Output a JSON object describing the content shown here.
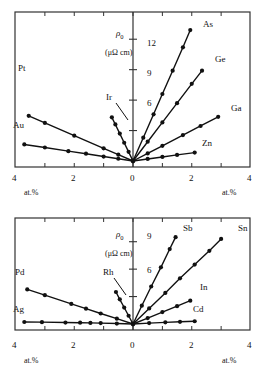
{
  "figure": {
    "title": "",
    "panels": [
      {
        "id": "top",
        "y_axis_label": "ρ",
        "y_axis_label_sub": "0",
        "y_axis_units": "(μΩ cm)",
        "y_ticks": [
          3,
          6,
          9,
          12
        ],
        "y_tick_labels": [
          "",
          "6",
          "9",
          "12"
        ],
        "x_ticks": [
          -4,
          -3,
          -2,
          -1,
          0,
          1,
          2,
          3,
          4
        ],
        "x_tick_labels": [
          "4",
          "",
          "2",
          "",
          "0",
          "",
          "2",
          "",
          "4"
        ],
        "x_axis_label_left": "at.%",
        "x_axis_label_right": "at.%",
        "ylim": [
          0,
          13.5
        ],
        "xlim": [
          -4,
          4
        ]
      },
      {
        "id": "bottom",
        "y_axis_label": "ρ",
        "y_axis_label_sub": "0",
        "y_axis_units": "(μΩ cm)",
        "y_ticks": [
          3,
          6,
          9
        ],
        "y_tick_labels": [
          "",
          "6",
          "9"
        ],
        "x_ticks": [
          -4,
          -3,
          -2,
          -1,
          0,
          1,
          2,
          3,
          4
        ],
        "x_tick_labels": [
          "4",
          "",
          "2",
          "",
          "0",
          "",
          "2",
          "",
          "4"
        ],
        "x_axis_label_left": "at.%",
        "x_axis_label_right": "at.%",
        "ylim": [
          0,
          10.5
        ],
        "xlim": [
          -4,
          4
        ]
      }
    ]
  },
  "chart_data": [
    {
      "type": "line",
      "panel": "top",
      "title": "",
      "xlabel": "at.%",
      "ylabel": "ρ₀ (μΩ cm)",
      "xlim": [
        -4,
        4
      ],
      "ylim": [
        0,
        13.5
      ],
      "xticks": [
        -4,
        -3,
        -2,
        -1,
        0,
        1,
        2,
        3,
        4
      ],
      "xticklabels": [
        "4",
        "",
        "2",
        "",
        "0",
        "",
        "2",
        "",
        "4"
      ],
      "yticks": [
        3,
        6,
        9,
        12
      ],
      "yticklabels": [
        "",
        "6",
        "9",
        "12"
      ],
      "grid": false,
      "legend": "inline-labels",
      "note": "Residual resistivity of dilute copper alloys versus solute concentration. Left half: solutes to the left of Cu in the periodic table; right half: solutes to the right.",
      "series": [
        {
          "name": "Pt",
          "label": "Pt",
          "side": "left",
          "points": [
            [
              0,
              0
            ],
            [
              -0.5,
              0.62
            ],
            [
              -1.0,
              1.25
            ],
            [
              -2.0,
              2.5
            ],
            [
              -3.0,
              3.75
            ],
            [
              -3.55,
              4.45
            ]
          ]
        },
        {
          "name": "Au",
          "label": "Au",
          "side": "left",
          "points": [
            [
              0,
              0
            ],
            [
              -0.5,
              0.22
            ],
            [
              -1.0,
              0.44
            ],
            [
              -1.6,
              0.72
            ],
            [
              -2.2,
              0.97
            ],
            [
              -3.0,
              1.33
            ],
            [
              -3.7,
              1.63
            ]
          ]
        },
        {
          "name": "Ir",
          "label": "Ir",
          "side": "left",
          "points": [
            [
              0,
              0
            ],
            [
              -0.15,
              0.9
            ],
            [
              -0.3,
              1.8
            ],
            [
              -0.45,
              2.7
            ],
            [
              -0.6,
              3.6
            ],
            [
              -0.72,
              4.3
            ]
          ]
        },
        {
          "name": "As",
          "label": "As",
          "side": "right",
          "points": [
            [
              0,
              0
            ],
            [
              0.35,
              2.3
            ],
            [
              0.7,
              4.6
            ],
            [
              1.0,
              6.6
            ],
            [
              1.35,
              8.9
            ],
            [
              1.7,
              11.2
            ],
            [
              1.95,
              12.9
            ]
          ]
        },
        {
          "name": "Ge",
          "label": "Ge",
          "side": "right",
          "points": [
            [
              0,
              0
            ],
            [
              0.5,
              1.9
            ],
            [
              1.0,
              3.8
            ],
            [
              1.5,
              5.7
            ],
            [
              2.0,
              7.6
            ],
            [
              2.35,
              8.9
            ]
          ]
        },
        {
          "name": "Ga",
          "label": "Ga",
          "side": "right",
          "points": [
            [
              0,
              0
            ],
            [
              0.5,
              0.75
            ],
            [
              1.0,
              1.5
            ],
            [
              1.7,
              2.55
            ],
            [
              2.3,
              3.45
            ],
            [
              2.9,
              4.35
            ]
          ]
        },
        {
          "name": "Zn",
          "label": "Zn",
          "side": "right",
          "points": [
            [
              0,
              0
            ],
            [
              0.5,
              0.2
            ],
            [
              1.0,
              0.4
            ],
            [
              1.5,
              0.6
            ],
            [
              2.1,
              0.83
            ]
          ]
        }
      ]
    },
    {
      "type": "line",
      "panel": "bottom",
      "title": "",
      "xlabel": "at.%",
      "ylabel": "ρ₀ (μΩ cm)",
      "xlim": [
        -4,
        4
      ],
      "ylim": [
        0,
        10.5
      ],
      "xticks": [
        -4,
        -3,
        -2,
        -1,
        0,
        1,
        2,
        3,
        4
      ],
      "xticklabels": [
        "4",
        "",
        "2",
        "",
        "0",
        "",
        "2",
        "",
        "4"
      ],
      "yticks": [
        3,
        6,
        9
      ],
      "yticklabels": [
        "",
        "6",
        "9"
      ],
      "grid": false,
      "legend": "inline-labels",
      "note": "Residual resistivity of dilute silver alloys versus solute concentration.",
      "series": [
        {
          "name": "Pd",
          "label": "Pd",
          "side": "left",
          "points": [
            [
              0,
              0
            ],
            [
              -0.55,
              0.58
            ],
            [
              -1.1,
              1.15
            ],
            [
              -1.6,
              1.68
            ],
            [
              -2.1,
              2.2
            ],
            [
              -3.0,
              3.15
            ],
            [
              -3.6,
              3.78
            ]
          ]
        },
        {
          "name": "Ag",
          "label": "Ag",
          "side": "left",
          "points": [
            [
              0,
              0
            ],
            [
              -0.55,
              0.05
            ],
            [
              -1.1,
              0.1
            ],
            [
              -1.45,
              0.12
            ],
            [
              -1.8,
              0.14
            ],
            [
              -2.3,
              0.16
            ],
            [
              -3.1,
              0.2
            ],
            [
              -3.7,
              0.22
            ]
          ]
        },
        {
          "name": "Rh",
          "label": "Rh",
          "side": "left",
          "points": [
            [
              0,
              0
            ],
            [
              -0.15,
              0.9
            ],
            [
              -0.3,
              1.8
            ],
            [
              -0.45,
              2.7
            ],
            [
              -0.58,
              3.5
            ]
          ]
        },
        {
          "name": "Sb",
          "label": "Sb",
          "side": "right",
          "points": [
            [
              0,
              0
            ],
            [
              0.3,
              2.0
            ],
            [
              0.62,
              4.1
            ],
            [
              0.95,
              6.2
            ],
            [
              1.25,
              8.2
            ],
            [
              1.45,
              9.5
            ]
          ]
        },
        {
          "name": "Sn",
          "label": "Sn",
          "side": "right",
          "points": [
            [
              0,
              0
            ],
            [
              0.55,
              1.7
            ],
            [
              1.1,
              3.4
            ],
            [
              1.6,
              5.0
            ],
            [
              2.1,
              6.5
            ],
            [
              2.6,
              8.0
            ],
            [
              3.0,
              9.3
            ]
          ]
        },
        {
          "name": "In",
          "label": "In",
          "side": "right",
          "points": [
            [
              0,
              0
            ],
            [
              0.5,
              0.65
            ],
            [
              1.0,
              1.3
            ],
            [
              1.5,
              1.95
            ],
            [
              1.95,
              2.55
            ]
          ]
        },
        {
          "name": "Cd",
          "label": "Cd",
          "side": "right",
          "points": [
            [
              0,
              0
            ],
            [
              0.55,
              0.1
            ],
            [
              1.1,
              0.18
            ],
            [
              1.6,
              0.24
            ],
            [
              2.1,
              0.3
            ]
          ]
        }
      ]
    }
  ],
  "labels": {
    "top": {
      "Pt": "Pt",
      "Au": "Au",
      "Ir": "Ir",
      "As": "As",
      "Ge": "Ge",
      "Ga": "Ga",
      "Zn": "Zn",
      "rho": "ρ",
      "rho_sub": "0",
      "units": "(μΩ cm)",
      "tick12": "12",
      "tick9": "9",
      "tick6": "6",
      "x_left_4": "4",
      "x_left_2": "2",
      "x_zero": "0",
      "x_right_2": "2",
      "x_right_4": "4",
      "at_left": "at.%",
      "at_right": "at.%"
    },
    "bottom": {
      "Pd": "Pd",
      "Ag": "Ag",
      "Rh": "Rh",
      "Sb": "Sb",
      "Sn": "Sn",
      "In": "In",
      "Cd": "Cd",
      "rho": "ρ",
      "rho_sub": "0",
      "units": "(μΩ cm)",
      "tick9": "9",
      "tick6": "6",
      "x_left_4": "4",
      "x_left_2": "2",
      "x_zero": "0",
      "x_right_2": "2",
      "x_right_4": "4",
      "at_left": "at.%",
      "at_right": "at.%"
    }
  },
  "colors": {
    "ink": "#111111",
    "background": "#ffffff",
    "frame": "#333333"
  }
}
